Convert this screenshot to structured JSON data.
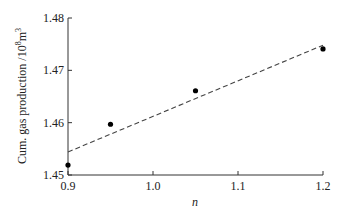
{
  "chart_data": {
    "type": "scatter",
    "title": "",
    "xlabel": "n",
    "ylabel": "Cum. gas production /10⁸m³",
    "xlim": [
      0.9,
      1.2
    ],
    "ylim": [
      1.45,
      1.48
    ],
    "x_ticks": [
      "0.9",
      "1.0",
      "1.1",
      "1.2"
    ],
    "y_ticks": [
      "1.45",
      "1.46",
      "1.47",
      "1.48"
    ],
    "grid": false,
    "legend": null,
    "series": [
      {
        "name": "data",
        "style": "marker",
        "x": [
          0.9,
          0.95,
          1.05,
          1.2
        ],
        "y": [
          1.4519,
          1.4597,
          1.4661,
          1.4741
        ]
      },
      {
        "name": "linear fit",
        "style": "dashed",
        "x": [
          0.9,
          1.2
        ],
        "y": [
          1.4544,
          1.4748
        ]
      }
    ]
  },
  "labels": {
    "xlabel": "n",
    "ylabel_main": "Cum. gas production /10",
    "ylabel_sup1": "8",
    "ylabel_mid": "m",
    "ylabel_sup2": "3"
  },
  "colors": {
    "axis": "#333333",
    "marker": "#000000",
    "fit_line": "#444444"
  }
}
